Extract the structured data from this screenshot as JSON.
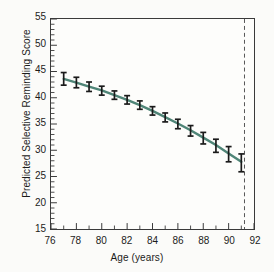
{
  "chart_data": {
    "type": "line",
    "title": "",
    "xlabel": "Age (years)",
    "ylabel": "Predicted Selective Reminding Score",
    "xlim": [
      76,
      92
    ],
    "ylim": [
      15,
      55
    ],
    "x_major_ticks": [
      76,
      78,
      80,
      82,
      84,
      86,
      88,
      90,
      92
    ],
    "x_minor_ticks": [
      77,
      79,
      81,
      83,
      85,
      87,
      89,
      91
    ],
    "y_major_ticks": [
      15,
      20,
      25,
      30,
      35,
      40,
      45,
      50,
      55
    ],
    "y_minor_step": 1,
    "grid": false,
    "legend": null,
    "series": [
      {
        "name": "Predicted score",
        "line_color": "#4f8577",
        "marker": "errorbar",
        "x": [
          77.0,
          78.0,
          79.0,
          80.0,
          81.0,
          82.0,
          83.0,
          84.0,
          85.0,
          86.0,
          87.0,
          88.0,
          89.0,
          90.0,
          91.0
        ],
        "values": [
          43.6,
          42.9,
          42.1,
          41.4,
          40.5,
          39.6,
          38.6,
          37.5,
          36.3,
          35.1,
          33.8,
          32.4,
          31.0,
          29.4,
          27.8
        ],
        "err_low": [
          42.4,
          41.9,
          41.2,
          40.5,
          39.7,
          38.8,
          37.8,
          36.7,
          35.4,
          34.1,
          32.7,
          31.2,
          29.6,
          27.8,
          25.9
        ],
        "err_high": [
          44.8,
          43.9,
          43.0,
          42.2,
          41.3,
          40.4,
          39.4,
          38.3,
          37.1,
          35.9,
          34.7,
          33.4,
          32.1,
          30.7,
          29.3
        ]
      }
    ],
    "annotations": [
      {
        "name": "reference-line",
        "type": "vline",
        "x": 91.25,
        "style": "dashed",
        "color": "#555555"
      }
    ]
  }
}
